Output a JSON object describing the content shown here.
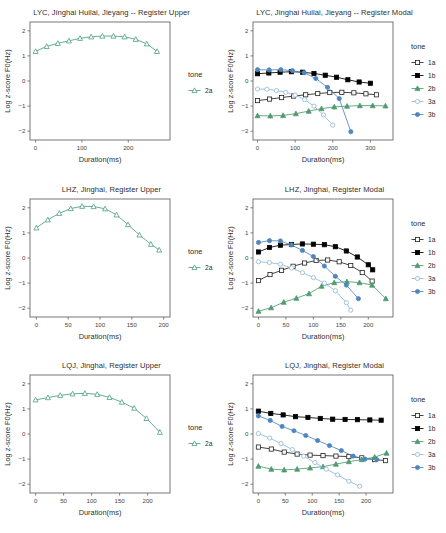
{
  "figure": {
    "rows": 3,
    "cols": 2,
    "axis_labels": {
      "x": "Duration(ms)",
      "y": "Log z-score F0(Hz)"
    },
    "legend_title": "tone",
    "colors": {
      "tone_1a": "#222222",
      "tone_1b": "#000000",
      "tone_2a": "#4a9e84",
      "tone_2b": "#4f9c6f",
      "tone_3a": "#8fb6d6",
      "tone_3b": "#4f86bd",
      "panel_border": "#555555",
      "background": "#ffffff"
    }
  },
  "chart_data": [
    {
      "type": "line",
      "title": "LYC, Jinghai Huilai, Jieyang -- Register Upper",
      "xlabel": "Duration(ms)",
      "ylabel": "Log z-score F0(Hz)",
      "xlim": [
        -12,
        290
      ],
      "ylim": [
        -2.35,
        2.35
      ],
      "xticks": [
        0,
        100,
        200
      ],
      "yticks": [
        -2,
        -1,
        0,
        1,
        2
      ],
      "grid": false,
      "legend_title": "tone",
      "legend_position": "right",
      "series": [
        {
          "name": "2a",
          "marker": "open-triangle",
          "color": "#4a9e84",
          "x": [
            0,
            24,
            48,
            72,
            96,
            120,
            144,
            168,
            192,
            216,
            240,
            262
          ],
          "y": [
            1.18,
            1.38,
            1.5,
            1.6,
            1.7,
            1.76,
            1.79,
            1.79,
            1.76,
            1.66,
            1.48,
            1.18
          ]
        }
      ]
    },
    {
      "type": "line",
      "title": "LYC, Jinghai Huilai, Jieyang -- Register Modal",
      "xlabel": "Duration(ms)",
      "ylabel": "Log z-score F0(Hz)",
      "xlim": [
        -12,
        360
      ],
      "ylim": [
        -2.35,
        2.35
      ],
      "xticks": [
        0,
        100,
        200,
        300
      ],
      "yticks": [
        -2,
        -1,
        0,
        1,
        2
      ],
      "grid": false,
      "legend_title": "tone",
      "legend_position": "right",
      "series": [
        {
          "name": "1a",
          "marker": "open-square",
          "color": "#222222",
          "x": [
            0,
            32,
            64,
            96,
            128,
            160,
            192,
            224,
            256,
            288,
            316
          ],
          "y": [
            -0.78,
            -0.72,
            -0.66,
            -0.6,
            -0.55,
            -0.5,
            -0.46,
            -0.45,
            -0.47,
            -0.51,
            -0.55
          ]
        },
        {
          "name": "1b",
          "marker": "filled-square",
          "color": "#000000",
          "x": [
            0,
            30,
            60,
            90,
            120,
            150,
            180,
            210,
            240,
            270,
            300
          ],
          "y": [
            0.29,
            0.32,
            0.35,
            0.37,
            0.35,
            0.3,
            0.23,
            0.15,
            0.05,
            -0.04,
            -0.09
          ]
        },
        {
          "name": "2b",
          "marker": "filled-triangle",
          "color": "#4f9c6f",
          "x": [
            0,
            34,
            68,
            102,
            136,
            170,
            204,
            238,
            272,
            306,
            340
          ],
          "y": [
            -1.38,
            -1.39,
            -1.37,
            -1.3,
            -1.2,
            -1.1,
            -1.03,
            -1.0,
            -0.98,
            -0.98,
            -0.99
          ]
        },
        {
          "name": "3a",
          "marker": "open-circle",
          "color": "#8fb6d6",
          "x": [
            0,
            25,
            50,
            75,
            100,
            125,
            150,
            175,
            200
          ],
          "y": [
            -0.32,
            -0.33,
            -0.38,
            -0.45,
            -0.56,
            -0.74,
            -1.0,
            -1.35,
            -1.76
          ]
        },
        {
          "name": "3b",
          "marker": "filled-circle",
          "color": "#4f86bd",
          "x": [
            0,
            31,
            62,
            93,
            124,
            155,
            186,
            217,
            248
          ],
          "y": [
            0.45,
            0.44,
            0.45,
            0.41,
            0.33,
            0.1,
            -0.25,
            -0.7,
            -2.02
          ]
        }
      ]
    },
    {
      "type": "line",
      "title": "LHZ, Jinghai, Register Upper",
      "xlabel": "Duration(ms)",
      "ylabel": "Log z-score F0(Hz)",
      "xlim": [
        -10,
        210
      ],
      "ylim": [
        -2.35,
        2.35
      ],
      "xticks": [
        0,
        50,
        100,
        150,
        200
      ],
      "yticks": [
        -2,
        -1,
        0,
        1,
        2
      ],
      "grid": false,
      "legend_title": "tone",
      "legend_position": "right",
      "series": [
        {
          "name": "2a",
          "marker": "open-triangle",
          "color": "#4a9e84",
          "x": [
            0,
            18,
            36,
            54,
            72,
            90,
            108,
            126,
            144,
            162,
            180,
            193
          ],
          "y": [
            1.2,
            1.52,
            1.78,
            1.97,
            2.06,
            2.05,
            1.96,
            1.72,
            1.33,
            0.92,
            0.55,
            0.32
          ]
        }
      ]
    },
    {
      "type": "line",
      "title": "LHZ, Jinghai, Register Modal",
      "xlabel": "Duration(ms)",
      "ylabel": "Log z-score F0(Hz)",
      "xlim": [
        -10,
        245
      ],
      "ylim": [
        -2.35,
        2.35
      ],
      "xticks": [
        0,
        50,
        100,
        150,
        200
      ],
      "yticks": [
        -2,
        -1,
        0,
        1,
        2
      ],
      "grid": false,
      "legend_title": "tone",
      "legend_position": "right",
      "series": [
        {
          "name": "1a",
          "marker": "open-square",
          "color": "#222222",
          "x": [
            0,
            21,
            42,
            63,
            84,
            105,
            126,
            147,
            168,
            189,
            207
          ],
          "y": [
            -0.9,
            -0.66,
            -0.49,
            -0.33,
            -0.2,
            -0.1,
            -0.08,
            -0.15,
            -0.3,
            -0.58,
            -0.92
          ]
        },
        {
          "name": "1b",
          "marker": "filled-square",
          "color": "#000000",
          "x": [
            0,
            20,
            40,
            60,
            80,
            100,
            120,
            140,
            160,
            180,
            200,
            208
          ],
          "y": [
            0.24,
            0.42,
            0.51,
            0.54,
            0.56,
            0.55,
            0.53,
            0.45,
            0.28,
            0.04,
            -0.27,
            -0.47
          ]
        },
        {
          "name": "2b",
          "marker": "filled-triangle",
          "color": "#4f9c6f",
          "x": [
            0,
            23,
            46,
            69,
            92,
            115,
            138,
            161,
            184,
            207,
            232
          ],
          "y": [
            -2.12,
            -1.98,
            -1.76,
            -1.6,
            -1.42,
            -1.12,
            -0.98,
            -0.94,
            -0.98,
            -1.08,
            -1.62
          ]
        },
        {
          "name": "3a",
          "marker": "open-circle",
          "color": "#8fb6d6",
          "x": [
            0,
            20,
            40,
            60,
            80,
            100,
            120,
            140,
            160,
            168
          ],
          "y": [
            -0.15,
            -0.18,
            -0.25,
            -0.4,
            -0.58,
            -0.78,
            -1.0,
            -1.3,
            -1.78,
            -2.08
          ]
        },
        {
          "name": "3b",
          "marker": "filled-circle",
          "color": "#4f86bd",
          "x": [
            0,
            20,
            40,
            60,
            80,
            100,
            120,
            140,
            160,
            182
          ],
          "y": [
            0.62,
            0.69,
            0.68,
            0.52,
            0.3,
            0.06,
            -0.32,
            -0.73,
            -1.08,
            -1.62
          ]
        }
      ]
    },
    {
      "type": "line",
      "title": "LQJ, Jinghai, Register Upper",
      "xlabel": "Duration(ms)",
      "ylabel": "Log z-score F0(Hz)",
      "xlim": [
        -10,
        240
      ],
      "ylim": [
        -2.35,
        2.35
      ],
      "xticks": [
        0,
        50,
        100,
        150,
        200
      ],
      "yticks": [
        -2,
        -1,
        0,
        1,
        2
      ],
      "grid": false,
      "legend_title": "tone",
      "legend_position": "right",
      "series": [
        {
          "name": "2a",
          "marker": "open-triangle",
          "color": "#4a9e84",
          "x": [
            0,
            22,
            44,
            66,
            88,
            110,
            132,
            154,
            176,
            198,
            222
          ],
          "y": [
            1.36,
            1.45,
            1.54,
            1.6,
            1.62,
            1.58,
            1.46,
            1.27,
            1.03,
            0.62,
            0.07
          ]
        }
      ]
    },
    {
      "type": "line",
      "title": "LQJ, Jinghai, Register Modal",
      "xlabel": "Duration(ms)",
      "ylabel": "Log z-score F0(Hz)",
      "xlim": [
        -10,
        250
      ],
      "ylim": [
        -2.35,
        2.35
      ],
      "xticks": [
        0,
        50,
        100,
        150,
        200
      ],
      "yticks": [
        -2,
        -1,
        0,
        1,
        2
      ],
      "grid": false,
      "legend_title": "tone",
      "legend_position": "right",
      "series": [
        {
          "name": "1a",
          "marker": "open-square",
          "color": "#222222",
          "x": [
            0,
            24,
            48,
            72,
            96,
            120,
            144,
            168,
            192,
            216,
            236
          ],
          "y": [
            -0.52,
            -0.6,
            -0.72,
            -0.8,
            -0.84,
            -0.86,
            -0.88,
            -0.9,
            -0.95,
            -1.02,
            -1.06
          ]
        },
        {
          "name": "1b",
          "marker": "filled-square",
          "color": "#000000",
          "x": [
            0,
            23,
            46,
            69,
            92,
            115,
            138,
            161,
            184,
            207,
            228
          ],
          "y": [
            0.91,
            0.82,
            0.76,
            0.69,
            0.66,
            0.62,
            0.59,
            0.58,
            0.57,
            0.56,
            0.55
          ]
        },
        {
          "name": "2b",
          "marker": "filled-triangle",
          "color": "#4f9c6f",
          "x": [
            0,
            24,
            48,
            72,
            96,
            120,
            144,
            168,
            192,
            216,
            238
          ],
          "y": [
            -1.28,
            -1.4,
            -1.43,
            -1.4,
            -1.35,
            -1.3,
            -1.2,
            -1.1,
            -1.02,
            -0.92,
            -0.76
          ]
        },
        {
          "name": "3a",
          "marker": "open-circle",
          "color": "#8fb6d6",
          "x": [
            0,
            21,
            42,
            63,
            84,
            105,
            126,
            147,
            168,
            188
          ],
          "y": [
            0.02,
            -0.16,
            -0.38,
            -0.62,
            -0.88,
            -1.14,
            -1.4,
            -1.63,
            -1.88,
            -2.08
          ]
        },
        {
          "name": "3b",
          "marker": "filled-circle",
          "color": "#4f86bd",
          "x": [
            0,
            22,
            44,
            66,
            88,
            110,
            132,
            154,
            176,
            198,
            220
          ],
          "y": [
            0.72,
            0.54,
            0.3,
            0.13,
            -0.06,
            -0.26,
            -0.46,
            -0.66,
            -0.88,
            -1.0,
            -1.02
          ]
        }
      ]
    }
  ]
}
